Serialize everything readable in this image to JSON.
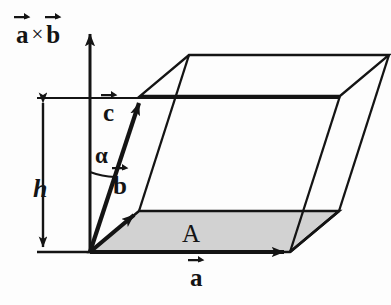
{
  "figure": {
    "colors": {
      "ink": "#141414",
      "background": "#fdfdfd",
      "base_fill": "#d2d2d2",
      "base_fill_edge": "#141414"
    },
    "labels": {
      "axis": {
        "first": "a",
        "operator": "×",
        "second": "b"
      },
      "height": "h",
      "angle": "α",
      "area": "A",
      "vector_a": "a",
      "vector_b": "b",
      "vector_c": "c"
    },
    "geometry": {
      "origin": [
        90,
        252
      ],
      "axis_tip": [
        90,
        30
      ],
      "vector_a_tip": [
        290,
        252
      ],
      "vector_b_tip": [
        139,
        211
      ],
      "vector_c_tip": [
        140,
        96
      ],
      "height_line_y": 98,
      "dimension_line_x": 43,
      "baseline_y": 252
    },
    "elements": [
      "vertical-axis-a-cross-b",
      "height-dimension-line",
      "angle-arc-alpha",
      "shaded-base-parallelogram",
      "parallelepiped-wireframe",
      "vector-a",
      "vector-b",
      "vector-c"
    ]
  }
}
